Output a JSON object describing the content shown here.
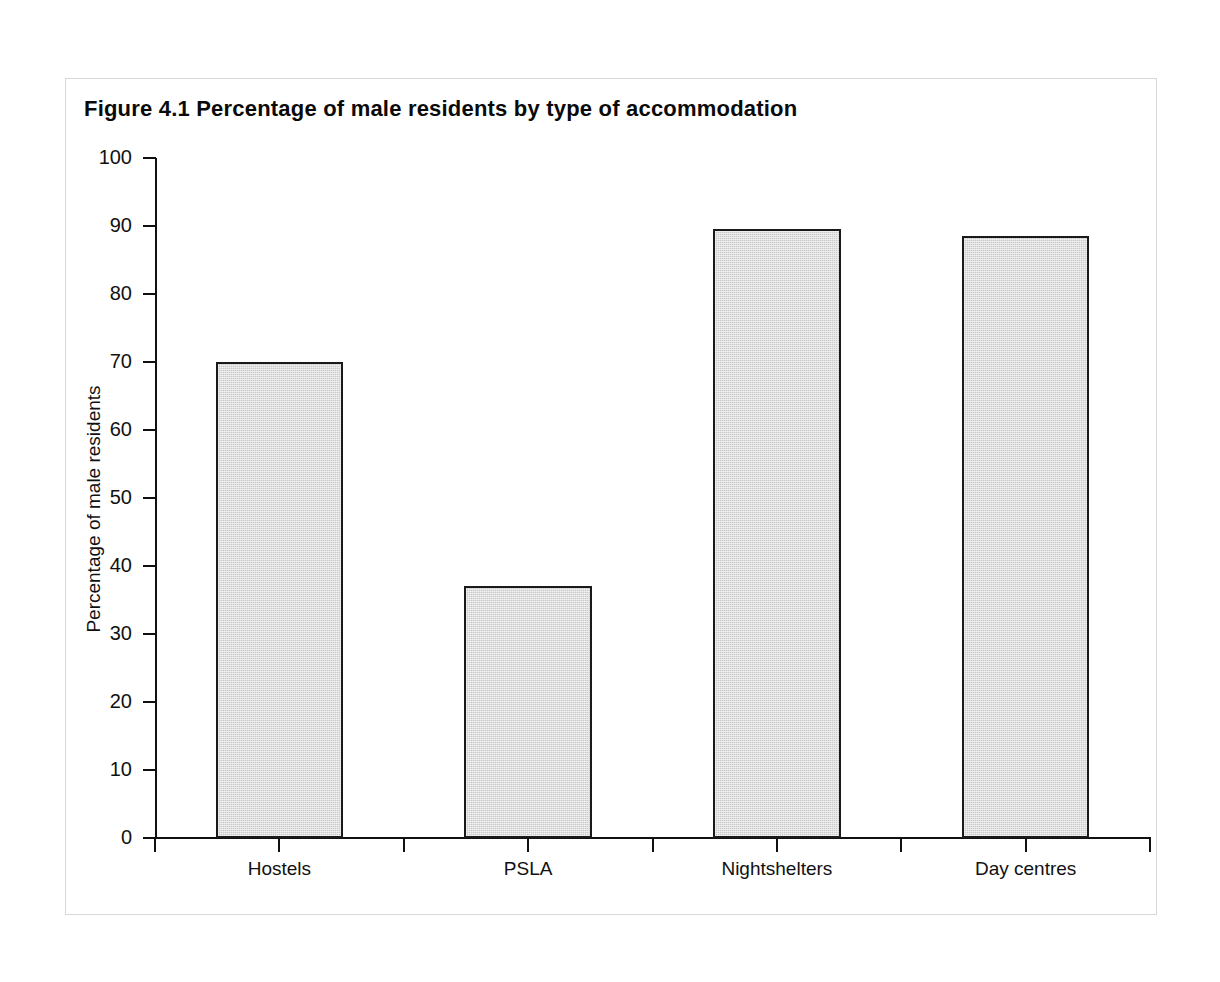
{
  "figure": {
    "title": "Figure 4.1  Percentage of male residents by type of accommodation"
  },
  "chart_data": {
    "type": "bar",
    "title": "Figure 4.1  Percentage of male residents by type of accommodation",
    "categories": [
      "Hostels",
      "PSLA",
      "Nightshelters",
      "Day centres"
    ],
    "values": [
      70,
      37,
      89.5,
      88.5
    ],
    "xlabel": "",
    "ylabel": "Percentage of male residents",
    "ylim": [
      0,
      100
    ],
    "ytick_labels": [
      "0",
      "10",
      "20",
      "30",
      "40",
      "50",
      "60",
      "70",
      "80",
      "90",
      "100"
    ],
    "ytick_values": [
      0,
      10,
      20,
      30,
      40,
      50,
      60,
      70,
      80,
      90,
      100
    ],
    "grid": false,
    "legend": false,
    "bar_fill_color": "#c9c9c9",
    "bar_edge_color": "#1a1a1a",
    "axis_color": "#111111",
    "background_color": "#ffffff"
  }
}
